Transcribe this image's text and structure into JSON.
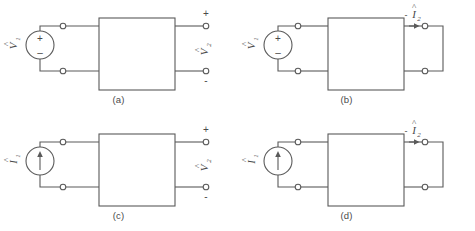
{
  "figure": {
    "type": "two-port-network-excitation-diagrams",
    "background_color": "#ffffff",
    "line_color": "#5a5a5a",
    "text_color": "#4a4a4a",
    "panels": [
      {
        "id": "a",
        "caption": "(a)",
        "source": {
          "kind": "voltage-source",
          "label_main": "V",
          "label_sub": "1",
          "label_hat": "^",
          "plus": "+",
          "minus": "–"
        },
        "network": {
          "label": ""
        },
        "output": {
          "kind": "open-circuit",
          "label_main": "V",
          "label_sub": "2",
          "label_hat": "^",
          "plus": "+",
          "minus": "-"
        }
      },
      {
        "id": "b",
        "caption": "(b)",
        "source": {
          "kind": "voltage-source",
          "label_main": "V",
          "label_sub": "1",
          "label_hat": "^",
          "plus": "+",
          "minus": "–"
        },
        "network": {
          "label": ""
        },
        "output": {
          "kind": "short-circuit",
          "prefix": "-",
          "label_main": "I",
          "label_sub": "2",
          "label_hat": "^",
          "arrow_direction": "right"
        }
      },
      {
        "id": "c",
        "caption": "(c)",
        "source": {
          "kind": "current-source",
          "label_main": "I",
          "label_sub": "1",
          "label_hat": "^",
          "arrow_direction": "up"
        },
        "network": {
          "label": ""
        },
        "output": {
          "kind": "open-circuit",
          "label_main": "V",
          "label_sub": "2",
          "label_hat": "^",
          "plus": "+",
          "minus": "-"
        }
      },
      {
        "id": "d",
        "caption": "(d)",
        "source": {
          "kind": "current-source",
          "label_main": "I",
          "label_sub": "1",
          "label_hat": "^",
          "arrow_direction": "up"
        },
        "network": {
          "label": ""
        },
        "output": {
          "kind": "short-circuit",
          "prefix": "-",
          "label_main": "I",
          "label_sub": "2",
          "label_hat": "^",
          "arrow_direction": "right"
        }
      }
    ]
  }
}
